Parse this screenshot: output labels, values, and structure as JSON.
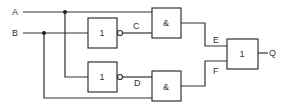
{
  "diagram": {
    "type": "logic-circuit",
    "inputs": [
      {
        "id": "A",
        "label": "A"
      },
      {
        "id": "B",
        "label": "B"
      }
    ],
    "gates": [
      {
        "id": "not1",
        "symbol": "1",
        "kind": "NOT",
        "inputs": [
          "B"
        ],
        "output": "C"
      },
      {
        "id": "not2",
        "symbol": "1",
        "kind": "NOT",
        "inputs": [
          "A"
        ],
        "output": "D"
      },
      {
        "id": "and1",
        "symbol": "&",
        "kind": "AND",
        "inputs": [
          "A",
          "C"
        ],
        "output": "E"
      },
      {
        "id": "and2",
        "symbol": "&",
        "kind": "AND",
        "inputs": [
          "D",
          "B"
        ],
        "output": "F"
      },
      {
        "id": "or1",
        "symbol": "1",
        "kind": "OR",
        "inputs": [
          "E",
          "F"
        ],
        "output": "Q"
      }
    ],
    "signal_labels": {
      "C": "C",
      "D": "D",
      "E": "E",
      "F": "F",
      "Q": "Q"
    }
  }
}
